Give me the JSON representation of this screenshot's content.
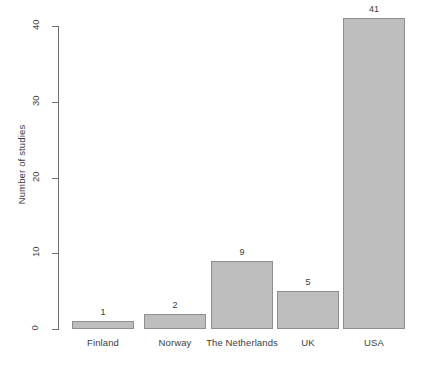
{
  "chart_data": {
    "type": "bar",
    "title": "",
    "subtitle": "",
    "xlabel": "",
    "ylabel": "Number of studies",
    "categories": [
      "Finland",
      "Norway",
      "The Netherlands",
      "UK",
      "USA"
    ],
    "values": [
      1,
      2,
      9,
      5,
      41
    ],
    "value_labels": [
      "1",
      "2",
      "9",
      "5",
      "41"
    ],
    "ylim": [
      0,
      40
    ],
    "y_ticks": [
      0,
      10,
      20,
      30,
      40
    ],
    "y_tick_labels": [
      "0",
      "10",
      "20",
      "30",
      "40"
    ],
    "grid": false,
    "legend": false,
    "legend_position": "none",
    "bar_fill_color": "#bebebe",
    "bar_border_color": "#8f8f8f",
    "axis_color": "#6f6f6f",
    "text_color": "#3d3d3d",
    "background_color": "#ffffff",
    "series": [
      {
        "name": "Number of studies",
        "values": [
          1,
          2,
          9,
          5,
          41
        ]
      }
    ]
  }
}
